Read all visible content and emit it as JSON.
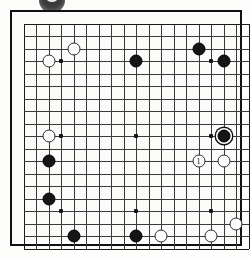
{
  "diagram": {
    "kind": "go-board-diagram",
    "board_size": 19,
    "visible_lines": 19,
    "grid": {
      "origin_x": 13.5,
      "origin_y": 13.5,
      "spacing": 12.5,
      "star_points": [
        [
          3,
          3
        ],
        [
          9,
          3
        ],
        [
          15,
          3
        ],
        [
          3,
          9
        ],
        [
          9,
          9
        ],
        [
          15,
          9
        ],
        [
          3,
          15
        ],
        [
          9,
          15
        ],
        [
          15,
          15
        ]
      ]
    },
    "move_labels": {
      "1": "1"
    },
    "stones": [
      {
        "color": "white",
        "col": 4,
        "row": 2,
        "label": "",
        "marked": false
      },
      {
        "color": "white",
        "col": 2,
        "row": 3,
        "label": "",
        "marked": false
      },
      {
        "color": "black",
        "col": 9,
        "row": 3,
        "label": "",
        "marked": false
      },
      {
        "color": "black",
        "col": 14,
        "row": 2,
        "label": "",
        "marked": false
      },
      {
        "color": "black",
        "col": 16,
        "row": 3,
        "label": "",
        "marked": false
      },
      {
        "color": "white",
        "col": 2,
        "row": 9,
        "label": "",
        "marked": false
      },
      {
        "color": "black",
        "col": 16,
        "row": 9,
        "label": "",
        "marked": true
      },
      {
        "color": "black",
        "col": 2,
        "row": 11,
        "label": "",
        "marked": false
      },
      {
        "color": "white",
        "col": 14,
        "row": 11,
        "label": "1",
        "marked": false
      },
      {
        "color": "white",
        "col": 16,
        "row": 11,
        "label": "",
        "marked": false
      },
      {
        "color": "black",
        "col": 2,
        "row": 14,
        "label": "",
        "marked": false
      },
      {
        "color": "white",
        "col": 17,
        "row": 16,
        "label": "",
        "marked": false
      },
      {
        "color": "black",
        "col": 4,
        "row": 17,
        "label": "",
        "marked": false
      },
      {
        "color": "black",
        "col": 9,
        "row": 17,
        "label": "",
        "marked": false
      },
      {
        "color": "white",
        "col": 11,
        "row": 17,
        "label": "",
        "marked": false
      },
      {
        "color": "white",
        "col": 15,
        "row": 17,
        "label": "",
        "marked": false
      }
    ],
    "colors": {
      "black_stone": "#151515",
      "white_stone": "#fdfdfd",
      "stone_outline": "#2c2c2c",
      "grid_line": "#3b3b3b",
      "board_border": "#111111",
      "board_background": "#fcfcfa",
      "page_background": "#fdfdfb"
    },
    "artifact": {
      "name": "cut-off-stone-from-previous-diagram",
      "description": "partial dark circle clipped at top edge of page"
    }
  }
}
